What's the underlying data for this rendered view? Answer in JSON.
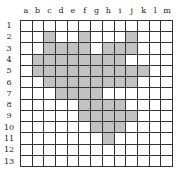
{
  "columns": [
    "a",
    "b",
    "c",
    "d",
    "e",
    "f",
    "g",
    "h",
    "i",
    "j",
    "k",
    "l",
    "m"
  ],
  "rows": [
    "1",
    "2",
    "3",
    "4",
    "5",
    "6",
    "7",
    "8",
    "9",
    "10",
    "11",
    "12",
    "13"
  ],
  "colors": {
    "filled": "#c2c2c2",
    "empty": "#ffffff",
    "line": "#333333"
  },
  "filled_cells": {
    "1": [],
    "2": [
      "c",
      "f",
      "j"
    ],
    "3": [
      "c",
      "d",
      "e",
      "f",
      "h",
      "i",
      "j"
    ],
    "4": [
      "b",
      "c",
      "d",
      "e",
      "f",
      "g",
      "h",
      "i"
    ],
    "5": [
      "b",
      "c",
      "d",
      "e",
      "f",
      "g",
      "h",
      "i",
      "j",
      "k"
    ],
    "6": [
      "c",
      "d",
      "e",
      "f",
      "g",
      "h",
      "i",
      "j"
    ],
    "7": [
      "d",
      "e",
      "f",
      "g"
    ],
    "8": [
      "f",
      "g",
      "h",
      "i"
    ],
    "9": [
      "f",
      "g",
      "h",
      "i",
      "j"
    ],
    "10": [
      "g",
      "h",
      "i"
    ],
    "11": [
      "h"
    ],
    "12": [],
    "13": []
  }
}
